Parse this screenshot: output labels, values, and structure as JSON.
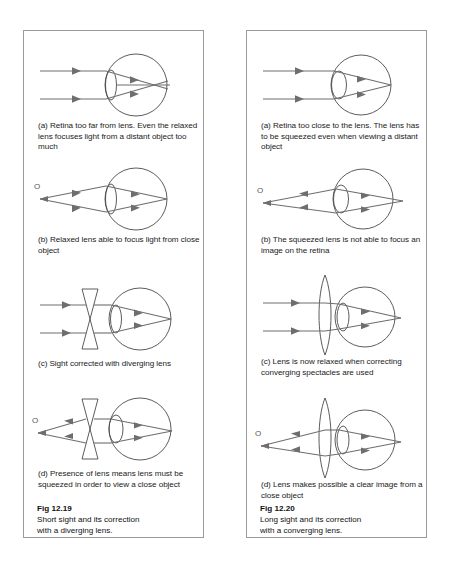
{
  "figures": [
    {
      "id": "fig-12-19",
      "number": "Fig 12.19",
      "title": "Short sight and its correction with a diverging lens.",
      "panels": [
        {
          "key": "a",
          "caption": "(a) Retina too far from lens. Even the relaxed lens focuses light from a distant object too much",
          "object_label": "",
          "rays": "parallel",
          "spectacle_lens": "none",
          "eye_lens": "relaxed",
          "focus": "in front of retina"
        },
        {
          "key": "b",
          "caption": "(b) Relaxed lens able to focus light from close object",
          "object_label": "O",
          "rays": "diverging",
          "spectacle_lens": "none",
          "eye_lens": "relaxed",
          "focus": "on retina"
        },
        {
          "key": "c",
          "caption": "(c) Sight corrected with diverging lens",
          "object_label": "",
          "rays": "parallel",
          "spectacle_lens": "diverging",
          "eye_lens": "relaxed",
          "focus": "on retina"
        },
        {
          "key": "d",
          "caption": "(d) Presence of lens means lens must be squeezed in order to view a close object",
          "object_label": "O",
          "rays": "diverging",
          "spectacle_lens": "diverging",
          "eye_lens": "squeezed",
          "focus": "on retina"
        }
      ]
    },
    {
      "id": "fig-12-20",
      "number": "Fig 12.20",
      "title": "Long sight and its correction with a converging lens.",
      "panels": [
        {
          "key": "a",
          "caption": "(a) Retina too close to the lens. The lens has to be squeezed even when viewing a distant object",
          "object_label": "",
          "rays": "parallel",
          "spectacle_lens": "none",
          "eye_lens": "squeezed",
          "focus": "on retina"
        },
        {
          "key": "b",
          "caption": "(b) The squeezed lens is not able to focus an image on the retina",
          "object_label": "O",
          "rays": "diverging",
          "spectacle_lens": "none",
          "eye_lens": "squeezed",
          "focus": "behind retina"
        },
        {
          "key": "c",
          "caption": "(c) Lens is now relaxed when correcting converging spectacles are used",
          "object_label": "",
          "rays": "parallel",
          "spectacle_lens": "converging",
          "eye_lens": "relaxed",
          "focus": "on retina"
        },
        {
          "key": "d",
          "caption": "(d) Lens makes possible a clear image from a close object",
          "object_label": "O",
          "rays": "diverging",
          "spectacle_lens": "converging",
          "eye_lens": "relaxed",
          "focus": "on retina"
        }
      ]
    }
  ],
  "colors": {
    "ray": "#6e6e6e",
    "outline": "#4a4a4a",
    "border": "#9a9a9a",
    "text": "#1a1a1a"
  }
}
